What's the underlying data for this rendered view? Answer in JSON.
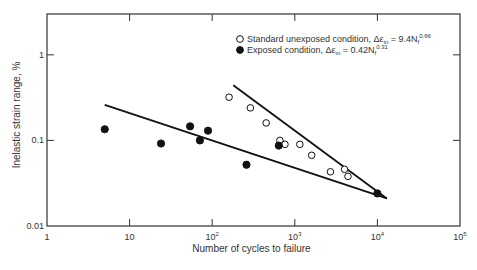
{
  "chart_data": {
    "type": "scatter",
    "title": "",
    "xlabel": "Number of cycles to failure",
    "ylabel": "Inelastic strain range, %",
    "xscale": "log",
    "yscale": "log",
    "xlim": [
      1,
      100000
    ],
    "ylim": [
      0.01,
      3
    ],
    "grid": false,
    "legend_position": "upper right",
    "x_ticks": [
      {
        "value": 1,
        "label": "1"
      },
      {
        "value": 10,
        "label": "10"
      },
      {
        "value": 100,
        "label": "10",
        "exp": "2"
      },
      {
        "value": 1000,
        "label": "10",
        "exp": "3"
      },
      {
        "value": 10000,
        "label": "10",
        "exp": "4"
      },
      {
        "value": 100000,
        "label": "10",
        "exp": "5"
      }
    ],
    "y_ticks": [
      {
        "value": 0.01,
        "label": "0.01"
      },
      {
        "value": 0.1,
        "label": "0.1"
      },
      {
        "value": 1,
        "label": "1"
      }
    ],
    "series": [
      {
        "name": "Standard unexposed condition",
        "equation_prefix": "Δε",
        "equation_sub": "in",
        "equation_body": " = 9.4N",
        "equation_body_sub": "f",
        "equation_exp": "-0.66",
        "equation_exp_display": "0.66",
        "marker": "open-circle",
        "points": [
          [
            160,
            0.32
          ],
          [
            290,
            0.24
          ],
          [
            450,
            0.16
          ],
          [
            660,
            0.1
          ],
          [
            760,
            0.09
          ],
          [
            1150,
            0.09
          ],
          [
            1600,
            0.067
          ],
          [
            2700,
            0.043
          ],
          [
            4000,
            0.046
          ],
          [
            4400,
            0.038
          ]
        ],
        "fit_line": [
          [
            180,
            0.44
          ],
          [
            13000,
            0.021
          ]
        ]
      },
      {
        "name": "Exposed condition",
        "equation_prefix": "Δε",
        "equation_sub": "in",
        "equation_body": " = 0.42N",
        "equation_body_sub": "f",
        "equation_exp": "-0.31",
        "equation_exp_display": "0.31",
        "marker": "filled-circle",
        "points": [
          [
            5,
            0.135
          ],
          [
            24,
            0.092
          ],
          [
            54,
            0.146
          ],
          [
            71,
            0.1
          ],
          [
            89,
            0.13
          ],
          [
            260,
            0.052
          ],
          [
            640,
            0.087
          ],
          [
            10000,
            0.024
          ]
        ],
        "fit_line": [
          [
            5,
            0.26
          ],
          [
            13000,
            0.021
          ]
        ]
      }
    ]
  },
  "layout": {
    "plot": {
      "left": 47,
      "top": 14,
      "right": 460,
      "bottom": 226
    },
    "colors": {
      "axis": "#333333",
      "marker": "#111111",
      "line": "#111111",
      "background": "#ffffff"
    }
  }
}
